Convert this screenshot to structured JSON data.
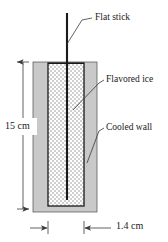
{
  "figure": {
    "background_color": "#ffffff",
    "width": 168,
    "height": 242
  },
  "colors": {
    "wall_fill": "#c9c9c9",
    "wall_stroke": "#4a4a4a",
    "ice_fill": "#ffffff",
    "ice_hatch": "#9a9a9a",
    "ice_stroke": "#1a1a1a",
    "stick_color": "#1a1a1a",
    "leader_color": "#3a3a3a",
    "dimension_color": "#3a3a3a",
    "text_color": "#1a1a1a"
  },
  "callouts": [
    {
      "id": "flat-stick",
      "label": "Flat stick",
      "text_x": 95,
      "text_y": 13,
      "leader": {
        "x1": 67,
        "y1": 44,
        "x2": 82,
        "y2": 20,
        "x3": 92,
        "y3": 18
      }
    },
    {
      "id": "flavored-ice",
      "label": "Flavored ice",
      "text_x": 106,
      "text_y": 75,
      "leader": {
        "x1": 73,
        "y1": 110,
        "x2": 99,
        "y2": 83,
        "x3": 104,
        "y3": 80
      }
    },
    {
      "id": "cooled-wall",
      "label": "Cooled wall",
      "text_x": 106,
      "text_y": 123,
      "leader": {
        "x1": 87,
        "y1": 163,
        "x2": 99,
        "y2": 131,
        "x3": 104,
        "y3": 128
      }
    }
  ],
  "dimensions": {
    "vertical": {
      "label": "15 cm",
      "value": 15,
      "unit": "cm",
      "text_x": 4,
      "text_y": 126,
      "line_x": 23,
      "y_top": 62,
      "y_bottom": 209
    },
    "horizontal": {
      "label": "1.4 cm",
      "value": 1.4,
      "unit": "cm",
      "text_x": 116,
      "text_y": 221,
      "line_y": 228,
      "tick_left_x": 48,
      "tick_right_x": 84,
      "arrow_left_start_x": 30,
      "arrow_right_start_x": 111
    }
  },
  "geometry": {
    "wall": {
      "x": 33,
      "y": 62,
      "width": 64,
      "height": 150
    },
    "cavity": {
      "x": 48,
      "y": 63,
      "width": 36,
      "height": 143
    },
    "stick": {
      "x": 66.5,
      "y_top": 13,
      "y_bottom": 200,
      "width": 2
    }
  }
}
